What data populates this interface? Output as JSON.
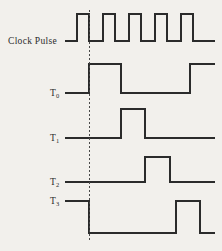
{
  "figure": {
    "kind": "digital-timing-diagram",
    "width": 222,
    "height": 251,
    "background_color": "#f2f0ec",
    "line_color": "#2b2b2b",
    "stroke_width": 1.6
  },
  "labels": {
    "clock": "Clock Pulse",
    "t0_main": "T",
    "t0_sub": "0",
    "t1_main": "T",
    "t1_sub": "1",
    "t2_main": "T",
    "t2_sub": "2",
    "t3_main": "T",
    "t3_sub": "3"
  },
  "chart_data": {
    "type": "line",
    "xlabel": "",
    "ylabel": "",
    "grid": false,
    "legend": "none",
    "x_axis": {
      "unit": "pixels",
      "plot_start": 65,
      "plot_end": 215,
      "clock_period": 26,
      "first_rising_edge": 77
    },
    "marker_line": {
      "name": "reference-dashed-line",
      "x": 89,
      "y_top": 10,
      "y_bottom": 240,
      "style": "dashed",
      "dash_pattern": "2,2"
    },
    "signals": [
      {
        "name": "Clock Pulse",
        "label": "Clock Pulse",
        "row_index": 0,
        "y_low": 41,
        "y_high": 14,
        "initial_level": "low",
        "lead_in_x": 65,
        "pulse_count": 5,
        "transitions": [
          {
            "x": 77,
            "to": "high"
          },
          {
            "x": 89,
            "to": "low"
          },
          {
            "x": 103,
            "to": "high"
          },
          {
            "x": 115,
            "to": "low"
          },
          {
            "x": 129,
            "to": "high"
          },
          {
            "x": 141,
            "to": "low"
          },
          {
            "x": 155,
            "to": "high"
          },
          {
            "x": 167,
            "to": "low"
          },
          {
            "x": 181,
            "to": "high"
          },
          {
            "x": 193,
            "to": "low"
          }
        ],
        "end_x": 215
      },
      {
        "name": "T0",
        "label": "T0",
        "row_index": 1,
        "y_low": 93,
        "y_high": 64,
        "initial_level": "low",
        "lead_in_x": 65,
        "transitions": [
          {
            "x": 89,
            "to": "high"
          },
          {
            "x": 121,
            "to": "low"
          },
          {
            "x": 190,
            "to": "high"
          }
        ],
        "end_x": 215
      },
      {
        "name": "T1",
        "label": "T1",
        "row_index": 2,
        "y_low": 138,
        "y_high": 109,
        "initial_level": "low",
        "lead_in_x": 65,
        "transitions": [
          {
            "x": 121,
            "to": "high"
          },
          {
            "x": 145,
            "to": "low"
          }
        ],
        "end_x": 215
      },
      {
        "name": "T2",
        "label": "T2",
        "row_index": 3,
        "y_low": 182,
        "y_high": 157,
        "initial_level": "low",
        "lead_in_x": 65,
        "transitions": [
          {
            "x": 145,
            "to": "high"
          },
          {
            "x": 170,
            "to": "low"
          }
        ],
        "end_x": 215
      },
      {
        "name": "T3",
        "label": "T3",
        "row_index": 4,
        "y_low": 233,
        "y_high": 201,
        "initial_level": "high",
        "lead_in_x": 65,
        "transitions": [
          {
            "x": 89,
            "to": "low"
          },
          {
            "x": 176,
            "to": "high"
          },
          {
            "x": 200,
            "to": "low"
          }
        ],
        "end_x": 215
      }
    ]
  }
}
